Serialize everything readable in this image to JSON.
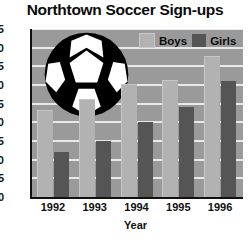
{
  "chart_data": {
    "type": "bar",
    "title": "Northtown Soccer Sign-ups",
    "xlabel": "Year",
    "ylabel": "",
    "categories": [
      "1992",
      "1993",
      "1994",
      "1995",
      "1996"
    ],
    "series": [
      {
        "name": "Boys",
        "values": [
          23,
          26,
          30,
          31,
          37.5
        ],
        "color": "#b2b2b2"
      },
      {
        "name": "Girls",
        "values": [
          12,
          15,
          20,
          24,
          31
        ],
        "color": "#555555"
      }
    ],
    "ylim": [
      0,
      45
    ],
    "ytick_step": 5,
    "yticks": [
      "45",
      "40",
      "35",
      "30",
      "25",
      "20",
      "15",
      "10",
      "5",
      "0"
    ],
    "grid": true,
    "legend_position": "top-right",
    "legend_entries": [
      "Boys",
      "Girls"
    ],
    "annotations": [
      "soccer-ball-graphic-overlay"
    ],
    "plot_background": "#9a9a9a",
    "gridline_color": "#e8e8e8",
    "axis_color": "#111111"
  },
  "decoration": {
    "ball_name": "soccer-ball-graphic",
    "ball_dark": "#000000",
    "ball_light": "#ffffff"
  }
}
